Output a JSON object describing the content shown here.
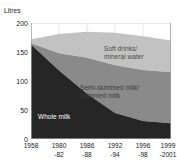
{
  "figure": {
    "top_bleed_text": "............",
    "axis": {
      "ylabel": "Litres",
      "yticks": [
        "200",
        "150",
        "100",
        "50",
        "0"
      ],
      "xticks": [
        {
          "line1": "1958",
          "line2": ""
        },
        {
          "line1": "1980",
          "line2": "-82"
        },
        {
          "line1": "1986",
          "line2": "-88"
        },
        {
          "line1": "1992",
          "line2": "-94"
        },
        {
          "line1": "1996",
          "line2": "-98"
        },
        {
          "line1": "1999",
          "line2": "-2001"
        }
      ]
    },
    "labels": {
      "soft_line1": "Soft drinks/",
      "soft_line2": "mineral water",
      "semi_line1": "Semi-skimmed milk/",
      "semi_line2": "skimmed milk",
      "whole": "Whole milk"
    },
    "colors": {
      "whole_milk": "#262626",
      "semi_skimmed": "#8a8a8a",
      "soft_drinks": "#c2c2c2",
      "gridline": "#d8d8d8",
      "axis": "#9a9a9a",
      "text": "#1a1a1a"
    }
  },
  "chart_data": {
    "type": "area",
    "stacked": true,
    "title": "",
    "xlabel": "",
    "ylabel": "Litres",
    "ylim": [
      0,
      200
    ],
    "yticks": [
      0,
      50,
      100,
      150,
      200
    ],
    "grid": true,
    "legend": "inline-labels",
    "categories": [
      "1958",
      "1980-82",
      "1986-88",
      "1992-94",
      "1996-98",
      "1999-2001"
    ],
    "series": [
      {
        "name": "Whole milk",
        "color": "#262626",
        "values": [
          163,
          118,
          78,
          45,
          31,
          27
        ]
      },
      {
        "name": "Semi-skimmed milk/skimmed milk",
        "color": "#8a8a8a",
        "values": [
          2,
          30,
          62,
          82,
          88,
          88
        ]
      },
      {
        "name": "Soft drinks/mineral water",
        "color": "#c2c2c2",
        "values": [
          7,
          33,
          45,
          56,
          58,
          55
        ]
      }
    ],
    "stack_totals": [
      172,
      181,
      185,
      183,
      177,
      170
    ]
  }
}
